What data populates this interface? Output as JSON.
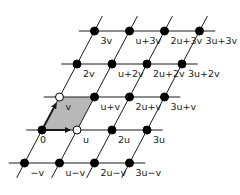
{
  "diagram": {
    "type": "lattice",
    "origin_px": [
      42,
      130
    ],
    "basis": {
      "u": {
        "label": "u",
        "px": [
          35,
          0
        ]
      },
      "v": {
        "label": "v",
        "px": [
          17.5,
          -33
        ]
      }
    },
    "colors": {
      "line": "#1a1a1a",
      "point": "#000000",
      "open_point_fill": "#ffffff",
      "cell_fill": "#b8b8b8"
    },
    "rows": [
      {
        "j": 3,
        "points": [
          {
            "i": 0,
            "label": "3v"
          },
          {
            "i": 1,
            "label": "u+3v"
          },
          {
            "i": 2,
            "label": "2u+3v"
          },
          {
            "i": 3,
            "label": "3u+3v"
          }
        ]
      },
      {
        "j": 2,
        "points": [
          {
            "i": 0,
            "label": "2v"
          },
          {
            "i": 1,
            "label": "u+2v"
          },
          {
            "i": 2,
            "label": "2u+2v"
          },
          {
            "i": 3,
            "label": "3u+2v"
          }
        ]
      },
      {
        "j": 1,
        "points": [
          {
            "i": 0,
            "label": "v",
            "open": true
          },
          {
            "i": 1,
            "label": "u+v"
          },
          {
            "i": 2,
            "label": "2u+v"
          },
          {
            "i": 3,
            "label": "3u+v"
          }
        ]
      },
      {
        "j": 0,
        "points": [
          {
            "i": 0,
            "label": "0"
          },
          {
            "i": 1,
            "label": "u",
            "open": true
          },
          {
            "i": 2,
            "label": "2u"
          },
          {
            "i": 3,
            "label": "3u"
          }
        ]
      },
      {
        "j": -1,
        "points": [
          {
            "i": 0,
            "label": "−v"
          },
          {
            "i": 1,
            "label": "u−v"
          },
          {
            "i": 2,
            "label": "2u−v"
          },
          {
            "i": 3,
            "label": "3u−v"
          }
        ]
      }
    ],
    "fundamental_cell": {
      "corners": [
        "0",
        "u",
        "u+v",
        "v"
      ],
      "shaded": true
    },
    "arrows": [
      {
        "from": "0",
        "to": "u",
        "label": "u"
      },
      {
        "from": "0",
        "to": "v",
        "label": "v"
      }
    ]
  }
}
